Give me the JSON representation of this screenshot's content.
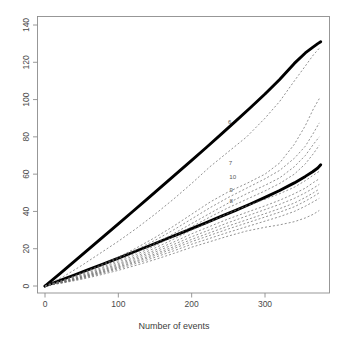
{
  "chart_data": {
    "type": "line",
    "title": "",
    "subtitle": "",
    "xlabel": "Number of events",
    "ylabel": "",
    "xlim": [
      -8,
      385
    ],
    "ylim": [
      -4,
      147
    ],
    "xticks": [
      0,
      100,
      200,
      300
    ],
    "yticks": [
      0,
      20,
      40,
      60,
      80,
      100,
      120,
      140
    ],
    "xtick_labels": [
      "0",
      "100",
      "200",
      "300"
    ],
    "ytick_labels": [
      "0",
      "20",
      "40",
      "60",
      "80",
      "100",
      "120",
      "140"
    ],
    "grid": false,
    "legend": "none",
    "y_tick_label_rotation": 90,
    "annotations": [
      {
        "label": "6",
        "x": 252,
        "y": 88
      },
      {
        "label": "7",
        "x": 253,
        "y": 66
      },
      {
        "label": "10",
        "x": 256,
        "y": 59
      },
      {
        "label": "9",
        "x": 254,
        "y": 52
      },
      {
        "label": "8",
        "x": 254,
        "y": 46
      }
    ],
    "series": [
      {
        "name": "upper-bound-thick",
        "style": "solid",
        "width": "thick",
        "color": "#000000",
        "x": [
          0,
          20,
          40,
          60,
          80,
          100,
          120,
          140,
          160,
          180,
          200,
          220,
          240,
          260,
          280,
          300,
          320,
          340,
          355,
          365,
          372,
          376
        ],
        "y": [
          0,
          6.5,
          13.2,
          19.9,
          26.6,
          33.3,
          40.1,
          46.9,
          53.7,
          60.5,
          67.4,
          74.3,
          81.3,
          88.4,
          95.6,
          103.0,
          110.8,
          119.4,
          125.0,
          128.0,
          130.0,
          131.0
        ]
      },
      {
        "name": "lower-bound-thick",
        "style": "solid",
        "width": "thick",
        "color": "#000000",
        "x": [
          0,
          20,
          40,
          60,
          80,
          100,
          120,
          140,
          160,
          180,
          200,
          220,
          240,
          260,
          280,
          300,
          320,
          340,
          355,
          365,
          372,
          376
        ],
        "y": [
          0,
          2.9,
          5.9,
          8.9,
          11.9,
          15.0,
          18.1,
          21.2,
          24.4,
          27.6,
          30.8,
          34.0,
          37.3,
          40.6,
          44.0,
          47.5,
          51.2,
          55.3,
          58.8,
          61.3,
          63.3,
          65.0
        ]
      },
      {
        "name": "curve-1",
        "style": "dashed",
        "width": "thin",
        "color": "#6e6e6e",
        "x": [
          0,
          25,
          50,
          75,
          100,
          125,
          150,
          175,
          200,
          225,
          250,
          275,
          300,
          320,
          340,
          355,
          366,
          374
        ],
        "y": [
          0,
          5.0,
          11.0,
          17.5,
          24.0,
          31.0,
          38.5,
          46.5,
          55.0,
          64.0,
          72.0,
          80.0,
          90.0,
          99.0,
          110.0,
          118.0,
          124.0,
          127.5
        ]
      },
      {
        "name": "curve-2",
        "style": "dashed",
        "width": "thin",
        "color": "#6e6e6e",
        "x": [
          0,
          25,
          50,
          75,
          100,
          125,
          150,
          175,
          200,
          225,
          250,
          275,
          300,
          320,
          340,
          355,
          366,
          374
        ],
        "y": [
          0,
          3.2,
          7.0,
          11.0,
          15.5,
          20.5,
          26.0,
          32.0,
          38.5,
          45.0,
          50.5,
          55.0,
          60.0,
          66.0,
          76.0,
          86.0,
          95.0,
          100.5
        ]
      },
      {
        "name": "curve-3",
        "style": "dashed",
        "width": "thin",
        "color": "#6e6e6e",
        "x": [
          0,
          25,
          50,
          75,
          100,
          125,
          150,
          175,
          200,
          225,
          250,
          275,
          300,
          320,
          340,
          355,
          366,
          374
        ],
        "y": [
          0,
          3.0,
          6.5,
          10.5,
          14.8,
          19.5,
          24.5,
          30.0,
          36.0,
          42.0,
          47.5,
          52.5,
          57.5,
          62.0,
          68.5,
          75.0,
          82.0,
          87.5
        ]
      },
      {
        "name": "curve-4",
        "style": "dashed",
        "width": "thin",
        "color": "#6e6e6e",
        "x": [
          0,
          25,
          50,
          75,
          100,
          125,
          150,
          175,
          200,
          225,
          250,
          275,
          300,
          320,
          340,
          355,
          366,
          374
        ],
        "y": [
          0,
          2.8,
          6.0,
          9.6,
          13.6,
          18.0,
          22.8,
          28.0,
          33.5,
          39.0,
          44.5,
          49.5,
          54.0,
          58.0,
          64.0,
          70.0,
          76.0,
          80.0
        ]
      },
      {
        "name": "curve-5",
        "style": "dashed",
        "width": "thin",
        "color": "#6e6e6e",
        "x": [
          0,
          25,
          50,
          75,
          100,
          125,
          150,
          175,
          200,
          225,
          250,
          275,
          300,
          320,
          340,
          355,
          366,
          374
        ],
        "y": [
          0,
          2.6,
          5.6,
          9.0,
          12.8,
          17.0,
          21.6,
          26.5,
          31.8,
          37.0,
          42.0,
          46.5,
          51.0,
          55.0,
          60.0,
          65.5,
          71.0,
          75.5
        ]
      },
      {
        "name": "curve-6",
        "style": "dashed",
        "width": "thin",
        "color": "#6e6e6e",
        "x": [
          0,
          25,
          50,
          75,
          100,
          125,
          150,
          175,
          200,
          225,
          250,
          275,
          300,
          320,
          340,
          355,
          366,
          374
        ],
        "y": [
          0,
          2.4,
          5.2,
          8.4,
          12.0,
          16.0,
          20.4,
          25.0,
          30.0,
          34.5,
          39.0,
          43.0,
          46.5,
          49.5,
          53.0,
          56.5,
          59.5,
          61.5
        ]
      },
      {
        "name": "curve-7",
        "style": "dashed",
        "width": "thin",
        "color": "#6e6e6e",
        "x": [
          0,
          25,
          50,
          75,
          100,
          125,
          150,
          175,
          200,
          225,
          250,
          275,
          300,
          320,
          340,
          355,
          366,
          374
        ],
        "y": [
          0,
          2.3,
          5.0,
          8.0,
          11.4,
          15.2,
          19.2,
          23.5,
          28.0,
          32.0,
          36.0,
          39.5,
          43.0,
          46.0,
          49.5,
          52.5,
          55.5,
          57.5
        ]
      },
      {
        "name": "curve-8",
        "style": "dashed",
        "width": "thin",
        "color": "#6e6e6e",
        "x": [
          0,
          25,
          50,
          75,
          100,
          125,
          150,
          175,
          200,
          225,
          250,
          275,
          300,
          320,
          340,
          355,
          366,
          374
        ],
        "y": [
          0,
          2.2,
          4.7,
          7.6,
          10.8,
          14.4,
          18.2,
          22.2,
          26.4,
          30.2,
          34.0,
          37.5,
          41.0,
          43.8,
          47.0,
          50.0,
          52.5,
          54.5
        ]
      },
      {
        "name": "curve-9",
        "style": "dashed",
        "width": "thin",
        "color": "#6e6e6e",
        "x": [
          0,
          25,
          50,
          75,
          100,
          125,
          150,
          175,
          200,
          225,
          250,
          275,
          300,
          320,
          340,
          355,
          366,
          374
        ],
        "y": [
          0,
          2.1,
          4.5,
          7.2,
          10.2,
          13.6,
          17.2,
          21.0,
          25.0,
          28.6,
          32.2,
          35.5,
          38.8,
          41.5,
          44.5,
          47.5,
          50.0,
          52.0
        ]
      },
      {
        "name": "curve-10",
        "style": "dashed",
        "width": "thin",
        "color": "#6e6e6e",
        "x": [
          0,
          25,
          50,
          75,
          100,
          125,
          150,
          175,
          200,
          225,
          250,
          275,
          300,
          320,
          340,
          355,
          366,
          374
        ],
        "y": [
          0,
          2.0,
          4.3,
          6.9,
          9.8,
          13.0,
          16.4,
          20.0,
          23.8,
          27.2,
          30.6,
          33.8,
          37.0,
          39.6,
          42.5,
          45.5,
          48.0,
          50.0
        ]
      },
      {
        "name": "curve-11",
        "style": "dashed",
        "width": "thin",
        "color": "#6e6e6e",
        "x": [
          0,
          25,
          50,
          75,
          100,
          125,
          150,
          175,
          200,
          225,
          250,
          275,
          300,
          320,
          340,
          355,
          366,
          374
        ],
        "y": [
          0,
          1.9,
          4.0,
          6.5,
          9.2,
          12.2,
          15.4,
          18.8,
          22.4,
          25.6,
          28.8,
          31.8,
          34.8,
          37.2,
          40.0,
          42.8,
          45.2,
          47.0
        ]
      },
      {
        "name": "curve-12",
        "style": "dashed",
        "width": "thin",
        "color": "#6e6e6e",
        "x": [
          0,
          25,
          50,
          75,
          100,
          125,
          150,
          175,
          200,
          225,
          250,
          275,
          300,
          320,
          340,
          355,
          366,
          374
        ],
        "y": [
          0,
          1.7,
          3.6,
          5.9,
          8.4,
          11.2,
          14.2,
          17.4,
          20.8,
          23.8,
          26.8,
          29.5,
          31.5,
          32.8,
          34.5,
          36.5,
          38.5,
          40.5
        ]
      }
    ]
  },
  "axes": {
    "x_title": "Number of events",
    "y_title": ""
  }
}
